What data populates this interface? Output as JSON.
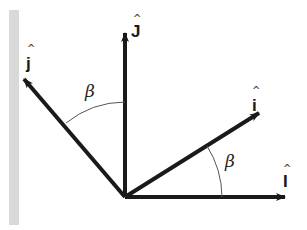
{
  "diagram": {
    "type": "vector-rotation",
    "colors": {
      "wall": "#d9d9d9",
      "vector": "#1a1a1a",
      "arc": "#555555"
    },
    "origin": {
      "x": 125,
      "y": 197
    },
    "vectors": [
      {
        "id": "J",
        "label": "J",
        "hat": "^",
        "tip": {
          "x": 125,
          "y": 30
        }
      },
      {
        "id": "I",
        "label": "I",
        "hat": "^",
        "tip": {
          "x": 288,
          "y": 197
        }
      },
      {
        "id": "j",
        "label": "j",
        "hat": "^",
        "tip": {
          "x": 22,
          "y": 77
        }
      },
      {
        "id": "i",
        "label": "i",
        "hat": "^",
        "tip": {
          "x": 262,
          "y": 111
        }
      }
    ],
    "angles": [
      {
        "id": "beta-upper",
        "label": "β"
      },
      {
        "id": "beta-lower",
        "label": "β"
      }
    ]
  }
}
